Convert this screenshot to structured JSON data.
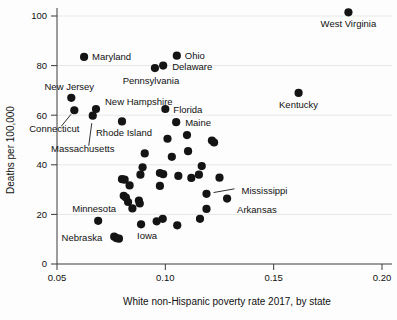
{
  "chart_data": {
    "type": "scatter",
    "title": "",
    "xlabel": "White non-Hispanic poverty rate 2017, by state",
    "ylabel": "Deaths per 100,000",
    "xlim": [
      0.0455,
      0.2005
    ],
    "ylim": [
      -3,
      106
    ],
    "xticks": [
      0.05,
      0.1,
      0.15,
      0.2
    ],
    "xtick_labels": [
      "0.05",
      "0.10",
      "0.15",
      "0.20"
    ],
    "yticks": [
      0,
      20,
      40,
      60,
      80,
      100
    ],
    "ytick_labels": [
      "0",
      "20",
      "40",
      "60",
      "80",
      "100"
    ],
    "grid": "horizontal-faint",
    "legend": "none",
    "marker_color": "#141414",
    "marker_size": 4.1,
    "points": [
      {
        "x": 0.1845,
        "y": 101.5,
        "label": "West Virginia",
        "label_dx": 0,
        "label_dy": 15,
        "anchor": "middle"
      },
      {
        "x": 0.1615,
        "y": 69.0,
        "label": "Kentucky",
        "label_dx": 0,
        "label_dy": 15,
        "anchor": "middle"
      },
      {
        "x": 0.0625,
        "y": 83.5,
        "label": "Maryland",
        "label_dx": 8,
        "label_dy": 3.5,
        "anchor": "start"
      },
      {
        "x": 0.1053,
        "y": 84.0,
        "label": "Ohio",
        "label_dx": 8,
        "label_dy": 3.5,
        "anchor": "start"
      },
      {
        "x": 0.0952,
        "y": 79.0,
        "label": "Pennsylvania",
        "label_dx": -4,
        "label_dy": 16,
        "anchor": "middle"
      },
      {
        "x": 0.099,
        "y": 80.0,
        "label": "Delaware",
        "label_dx": 9,
        "label_dy": 4,
        "anchor": "start"
      },
      {
        "x": 0.0566,
        "y": 67.0,
        "label": "New Jersey",
        "label_dx": -2,
        "label_dy": -8,
        "anchor": "middle"
      },
      {
        "x": 0.058,
        "y": 62.0,
        "label": "Connecticut",
        "label_dx": -20,
        "label_dy": 22,
        "anchor": "middle",
        "leader": true,
        "leader_to_dx": -13,
        "leader_to_dy": 16
      },
      {
        "x": 0.068,
        "y": 62.5,
        "label": "New Hampshire",
        "label_dx": 9,
        "label_dy": -4,
        "anchor": "start"
      },
      {
        "x": 0.0665,
        "y": 59.8,
        "label": "Massachusetts",
        "label_dx": -10,
        "label_dy": 36,
        "anchor": "middle",
        "leader": true,
        "leader_to_dx": -4,
        "leader_to_dy": 30
      },
      {
        "x": 0.08,
        "y": 57.5,
        "label": "Rhode Island",
        "label_dx": 2,
        "label_dy": 15,
        "anchor": "middle"
      },
      {
        "x": 0.1,
        "y": 62.5,
        "label": "Florida",
        "label_dx": 8,
        "label_dy": 4,
        "anchor": "start"
      },
      {
        "x": 0.105,
        "y": 57.2,
        "label": "Maine",
        "label_dx": 9,
        "label_dy": 4,
        "anchor": "start"
      },
      {
        "x": 0.119,
        "y": 28.3,
        "label": "Mississippi",
        "label_dx": 35,
        "label_dy": 0,
        "anchor": "start",
        "leader": true,
        "leader_to_dx": 28,
        "leader_to_dy": -5
      },
      {
        "x": 0.1285,
        "y": 26.4,
        "label": "Arkansas",
        "label_dx": 10,
        "label_dy": 14,
        "anchor": "start"
      },
      {
        "x": 0.069,
        "y": 17.4,
        "label": "Minnesota",
        "label_dx": -4,
        "label_dy": -9,
        "anchor": "middle"
      },
      {
        "x": 0.0764,
        "y": 11.0,
        "label": "Nebraska",
        "label_dx": -12,
        "label_dy": 4,
        "anchor": "end"
      },
      {
        "x": 0.0888,
        "y": 16.0,
        "label": "Iowa",
        "label_dx": 6,
        "label_dy": 15,
        "anchor": "middle"
      },
      {
        "x": 0.101,
        "y": 50.5,
        "label": "",
        "label_dx": 0,
        "label_dy": 0,
        "anchor": "start"
      },
      {
        "x": 0.11,
        "y": 52.0,
        "label": "",
        "label_dx": 0,
        "label_dy": 0,
        "anchor": "start"
      },
      {
        "x": 0.1215,
        "y": 49.8,
        "label": "",
        "label_dx": 0,
        "label_dy": 0,
        "anchor": "start"
      },
      {
        "x": 0.1225,
        "y": 49.0,
        "label": "",
        "label_dx": 0,
        "label_dy": 0,
        "anchor": "start"
      },
      {
        "x": 0.0905,
        "y": 44.6,
        "label": "",
        "label_dx": 0,
        "label_dy": 0,
        "anchor": "start"
      },
      {
        "x": 0.1105,
        "y": 45.5,
        "label": "",
        "label_dx": 0,
        "label_dy": 0,
        "anchor": "start"
      },
      {
        "x": 0.103,
        "y": 43.2,
        "label": "",
        "label_dx": 0,
        "label_dy": 0,
        "anchor": "start"
      },
      {
        "x": 0.0895,
        "y": 39.0,
        "label": "",
        "label_dx": 0,
        "label_dy": 0,
        "anchor": "start"
      },
      {
        "x": 0.1168,
        "y": 39.5,
        "label": "",
        "label_dx": 0,
        "label_dy": 0,
        "anchor": "start"
      },
      {
        "x": 0.0885,
        "y": 36.0,
        "label": "",
        "label_dx": 0,
        "label_dy": 0,
        "anchor": "start"
      },
      {
        "x": 0.0975,
        "y": 36.7,
        "label": "",
        "label_dx": 0,
        "label_dy": 0,
        "anchor": "start"
      },
      {
        "x": 0.099,
        "y": 36.2,
        "label": "",
        "label_dx": 0,
        "label_dy": 0,
        "anchor": "start"
      },
      {
        "x": 0.1155,
        "y": 36.0,
        "label": "",
        "label_dx": 0,
        "label_dy": 0,
        "anchor": "start"
      },
      {
        "x": 0.106,
        "y": 35.5,
        "label": "",
        "label_dx": 0,
        "label_dy": 0,
        "anchor": "start"
      },
      {
        "x": 0.112,
        "y": 34.7,
        "label": "",
        "label_dx": 0,
        "label_dy": 0,
        "anchor": "start"
      },
      {
        "x": 0.125,
        "y": 34.8,
        "label": "",
        "label_dx": 0,
        "label_dy": 0,
        "anchor": "start"
      },
      {
        "x": 0.08,
        "y": 34.2,
        "label": "",
        "label_dx": 0,
        "label_dy": 0,
        "anchor": "start"
      },
      {
        "x": 0.0812,
        "y": 34.0,
        "label": "",
        "label_dx": 0,
        "label_dy": 0,
        "anchor": "start"
      },
      {
        "x": 0.0975,
        "y": 31.5,
        "label": "",
        "label_dx": 0,
        "label_dy": 0,
        "anchor": "start"
      },
      {
        "x": 0.0835,
        "y": 31.7,
        "label": "",
        "label_dx": 0,
        "label_dy": 0,
        "anchor": "start"
      },
      {
        "x": 0.0808,
        "y": 27.5,
        "label": "",
        "label_dx": 0,
        "label_dy": 0,
        "anchor": "start"
      },
      {
        "x": 0.0818,
        "y": 26.8,
        "label": "",
        "label_dx": 0,
        "label_dy": 0,
        "anchor": "start"
      },
      {
        "x": 0.0828,
        "y": 25.0,
        "label": "",
        "label_dx": 0,
        "label_dy": 0,
        "anchor": "start"
      },
      {
        "x": 0.0878,
        "y": 25.6,
        "label": "",
        "label_dx": 0,
        "label_dy": 0,
        "anchor": "start"
      },
      {
        "x": 0.0882,
        "y": 24.4,
        "label": "",
        "label_dx": 0,
        "label_dy": 0,
        "anchor": "start"
      },
      {
        "x": 0.0848,
        "y": 22.4,
        "label": "",
        "label_dx": 0,
        "label_dy": 0,
        "anchor": "start"
      },
      {
        "x": 0.119,
        "y": 22.2,
        "label": "",
        "label_dx": 0,
        "label_dy": 0,
        "anchor": "start"
      },
      {
        "x": 0.096,
        "y": 17.2,
        "label": "",
        "label_dx": 0,
        "label_dy": 0,
        "anchor": "start"
      },
      {
        "x": 0.0988,
        "y": 18.2,
        "label": "",
        "label_dx": 0,
        "label_dy": 0,
        "anchor": "start"
      },
      {
        "x": 0.116,
        "y": 18.2,
        "label": "",
        "label_dx": 0,
        "label_dy": 0,
        "anchor": "start"
      },
      {
        "x": 0.1055,
        "y": 15.6,
        "label": "",
        "label_dx": 0,
        "label_dy": 0,
        "anchor": "start"
      },
      {
        "x": 0.0775,
        "y": 10.4,
        "label": "",
        "label_dx": 0,
        "label_dy": 0,
        "anchor": "start"
      },
      {
        "x": 0.0786,
        "y": 10.2,
        "label": "",
        "label_dx": 0,
        "label_dy": 0,
        "anchor": "start"
      }
    ]
  }
}
